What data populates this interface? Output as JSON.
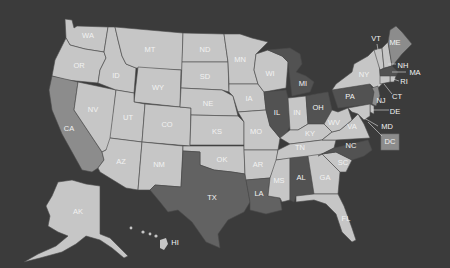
{
  "map": {
    "type": "US state choropleth map",
    "colors": {
      "background": "#3b3b3b",
      "light": "#c6c6c6",
      "medium": "#8c8c8c",
      "medium_dark": "#626262",
      "dark": "#525252",
      "label": "#f2f2f2",
      "border": "#4a4a4a"
    },
    "states": [
      {
        "abbr": "WA",
        "shade": "light"
      },
      {
        "abbr": "OR",
        "shade": "light"
      },
      {
        "abbr": "CA",
        "shade": "medium"
      },
      {
        "abbr": "NV",
        "shade": "light"
      },
      {
        "abbr": "ID",
        "shade": "light"
      },
      {
        "abbr": "MT",
        "shade": "light"
      },
      {
        "abbr": "WY",
        "shade": "light"
      },
      {
        "abbr": "UT",
        "shade": "light"
      },
      {
        "abbr": "CO",
        "shade": "light"
      },
      {
        "abbr": "AZ",
        "shade": "light"
      },
      {
        "abbr": "NM",
        "shade": "light"
      },
      {
        "abbr": "ND",
        "shade": "light"
      },
      {
        "abbr": "SD",
        "shade": "light"
      },
      {
        "abbr": "NE",
        "shade": "light"
      },
      {
        "abbr": "KS",
        "shade": "light"
      },
      {
        "abbr": "OK",
        "shade": "light"
      },
      {
        "abbr": "TX",
        "shade": "medium_dark"
      },
      {
        "abbr": "MN",
        "shade": "light"
      },
      {
        "abbr": "IA",
        "shade": "light"
      },
      {
        "abbr": "MO",
        "shade": "light"
      },
      {
        "abbr": "AR",
        "shade": "light"
      },
      {
        "abbr": "LA",
        "shade": "medium_dark"
      },
      {
        "abbr": "WI",
        "shade": "light"
      },
      {
        "abbr": "IL",
        "shade": "dark"
      },
      {
        "abbr": "MI",
        "shade": "dark"
      },
      {
        "abbr": "IN",
        "shade": "light"
      },
      {
        "abbr": "OH",
        "shade": "dark"
      },
      {
        "abbr": "KY",
        "shade": "light"
      },
      {
        "abbr": "TN",
        "shade": "light"
      },
      {
        "abbr": "MS",
        "shade": "light"
      },
      {
        "abbr": "AL",
        "shade": "dark"
      },
      {
        "abbr": "GA",
        "shade": "light"
      },
      {
        "abbr": "FL",
        "shade": "light"
      },
      {
        "abbr": "SC",
        "shade": "light"
      },
      {
        "abbr": "NC",
        "shade": "dark"
      },
      {
        "abbr": "VA",
        "shade": "light"
      },
      {
        "abbr": "WV",
        "shade": "light"
      },
      {
        "abbr": "PA",
        "shade": "dark"
      },
      {
        "abbr": "NY",
        "shade": "light"
      },
      {
        "abbr": "VT",
        "shade": "light"
      },
      {
        "abbr": "NH",
        "shade": "light"
      },
      {
        "abbr": "ME",
        "shade": "medium"
      },
      {
        "abbr": "MA",
        "shade": "dark"
      },
      {
        "abbr": "RI",
        "shade": "light"
      },
      {
        "abbr": "CT",
        "shade": "light"
      },
      {
        "abbr": "NJ",
        "shade": "medium"
      },
      {
        "abbr": "DE",
        "shade": "light"
      },
      {
        "abbr": "MD",
        "shade": "light"
      },
      {
        "abbr": "DC",
        "shade": "medium"
      },
      {
        "abbr": "AK",
        "shade": "light"
      },
      {
        "abbr": "HI",
        "shade": "light"
      }
    ]
  },
  "labels": {
    "WA": "WA",
    "OR": "OR",
    "CA": "CA",
    "NV": "NV",
    "ID": "ID",
    "MT": "MT",
    "WY": "WY",
    "UT": "UT",
    "CO": "CO",
    "AZ": "AZ",
    "NM": "NM",
    "ND": "ND",
    "SD": "SD",
    "NE": "NE",
    "KS": "KS",
    "OK": "OK",
    "TX": "TX",
    "MN": "MN",
    "IA": "IA",
    "MO": "MO",
    "AR": "AR",
    "LA": "LA",
    "WI": "WI",
    "IL": "IL",
    "MI": "MI",
    "IN": "IN",
    "OH": "OH",
    "KY": "KY",
    "TN": "TN",
    "MS": "MS",
    "AL": "AL",
    "GA": "GA",
    "FL": "FL",
    "SC": "SC",
    "NC": "NC",
    "VA": "VA",
    "WV": "WV",
    "PA": "PA",
    "NY": "NY",
    "VT": "VT",
    "NH": "NH",
    "ME": "ME",
    "MA": "MA",
    "RI": "RI",
    "CT": "CT",
    "NJ": "NJ",
    "DE": "DE",
    "MD": "MD",
    "DC": "DC",
    "AK": "AK",
    "HI": "HI"
  }
}
